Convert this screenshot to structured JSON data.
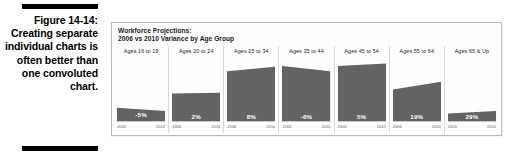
{
  "figure": {
    "number_label": "Figure 14-14:",
    "caption_text": "Creating separate individual charts is often better than one convoluted chart."
  },
  "chart_panel": {
    "title_line1": "Workforce Projections:",
    "title_line2": "2006 vs 2010 Variance by Age Group"
  },
  "colors": {
    "bar_fill": "#636363",
    "panel_border": "#b9b9b9",
    "divider": "#d8d8d8",
    "value_label": "#ffffff",
    "rule": "#000000"
  },
  "chart_data": {
    "type": "area",
    "title": "Workforce Projections: 2006 vs 2010 Variance by Age Group",
    "xlabel": "",
    "ylabel": "",
    "grid": false,
    "legend": "none",
    "x": [
      "2006",
      "2010"
    ],
    "categories": [
      "Ages 16 to 19",
      "Ages 20 to 24",
      "Ages 25 to 34",
      "Ages 35 to 44",
      "Ages 45 to 54",
      "Ages 55 to 64",
      "Ages 65 & Up"
    ],
    "variance_labels": [
      "-5%",
      "2%",
      "8%",
      "-6%",
      "5%",
      "19%",
      "29%"
    ],
    "variance_values": [
      -5,
      2,
      8,
      -6,
      5,
      19,
      29
    ],
    "panels": [
      {
        "category": "Ages 16 to 19",
        "variance_label": "-5%",
        "variance": -5,
        "start_height_pct": 22,
        "end_height_pct": 17,
        "axis_start": "2006",
        "axis_end": "2010"
      },
      {
        "category": "Ages 20 to 24",
        "variance_label": "2%",
        "variance": 2,
        "start_height_pct": 44,
        "end_height_pct": 45,
        "axis_start": "2006",
        "axis_end": "2010"
      },
      {
        "category": "Ages 25 to 34",
        "variance_label": "8%",
        "variance": 8,
        "start_height_pct": 78,
        "end_height_pct": 85,
        "axis_start": "2006",
        "axis_end": "2010"
      },
      {
        "category": "Ages 35 to 44",
        "variance_label": "-6%",
        "variance": -6,
        "start_height_pct": 86,
        "end_height_pct": 78,
        "axis_start": "2006",
        "axis_end": "2010"
      },
      {
        "category": "Ages 45 to 54",
        "variance_label": "5%",
        "variance": 5,
        "start_height_pct": 86,
        "end_height_pct": 90,
        "axis_start": "2006",
        "axis_end": "2010"
      },
      {
        "category": "Ages 55 to 64",
        "variance_label": "19%",
        "variance": 19,
        "start_height_pct": 50,
        "end_height_pct": 62,
        "axis_start": "2006",
        "axis_end": "2010"
      },
      {
        "category": "Ages 65 & Up",
        "variance_label": "29%",
        "variance": 29,
        "start_height_pct": 13,
        "end_height_pct": 17,
        "axis_start": "2006",
        "axis_end": "2010"
      }
    ]
  }
}
